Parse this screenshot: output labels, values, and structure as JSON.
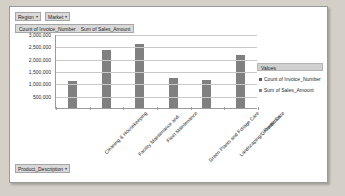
{
  "slicers": {
    "region": {
      "label": "Region",
      "arrow": "▾"
    },
    "market": {
      "label": "Market",
      "arrow": "▾"
    },
    "product": {
      "label": "Product_Description",
      "arrow": "▾"
    }
  },
  "values_bar": {
    "field1": "Count of Invoice_Number",
    "field2": "Sum of Sales_Amount"
  },
  "legend": {
    "title": "Values",
    "items": [
      {
        "label": "Count of Invoice_Number",
        "color": "#595959"
      },
      {
        "label": "Sum of Sales_Amount",
        "color": "#808080"
      }
    ]
  },
  "chart_data": {
    "type": "bar",
    "title": "",
    "xlabel": "",
    "ylabel": "",
    "grid": true,
    "legend_position": "right",
    "ylim": [
      0,
      3000000
    ],
    "ytick_labels": [
      "3,000,000",
      "2,500,000",
      "2,000,000",
      "1,500,000",
      "1,000,000",
      "500,000"
    ],
    "ytick_values": [
      3000000,
      2500000,
      2000000,
      1500000,
      1000000,
      500000
    ],
    "categories": [
      "Cleaning & Housekeeping",
      "Facility Maintenance and…",
      "Fleet Maintenance",
      "Green Plants and Foliage Care",
      "Landscaping/Grounds Care",
      "Predictive…"
    ],
    "series": [
      {
        "name": "Sum of Sales_Amount",
        "color": "#808080",
        "values": [
          1100000,
          2350000,
          2600000,
          1200000,
          1120000,
          2150000
        ]
      }
    ]
  }
}
